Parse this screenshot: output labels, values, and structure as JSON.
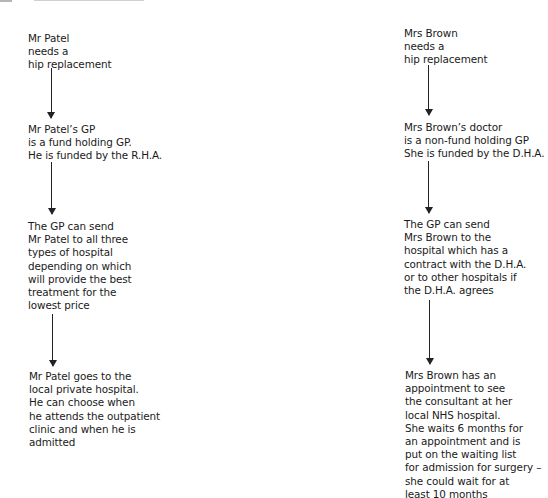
{
  "diagram": {
    "type": "flowchart",
    "header_cutoff": true,
    "columns": [
      {
        "name": "patel",
        "nodes": [
          "Mr Patel\nneeds a\nhip replacement",
          "Mr Patel’s GP\nis a fund holding GP.\nHe is funded by the R.H.A.",
          "The GP can send\nMr Patel to all three\ntypes of hospital\ndepending on which\nwill provide the best\ntreatment for the\nlowest price",
          "Mr Patel goes to the\nlocal private hospital.\nHe can choose when\nhe attends the outpatient\nclinic and when he is\nadmitted"
        ]
      },
      {
        "name": "brown",
        "nodes": [
          "Mrs Brown\nneeds a\nhip replacement",
          "Mrs Brown’s doctor\nis a non-fund holding GP\nShe is funded by the D.H.A.",
          "The GP can send\nMrs Brown to the\nhospital which has a\ncontract with the D.H.A.\nor to other hospitals if\nthe D.H.A. agrees",
          "Mrs Brown has an\nappointment to see\nthe consultant at her\nlocal NHS hospital.\nShe waits 6 months for\nan appointment and is\nput on the waiting list\nfor admission for surgery –\nshe could wait for at\nleast 10 months"
        ]
      }
    ],
    "edges": [
      {
        "column": "patel",
        "from": 0,
        "to": 1
      },
      {
        "column": "patel",
        "from": 1,
        "to": 2
      },
      {
        "column": "patel",
        "from": 2,
        "to": 3
      },
      {
        "column": "brown",
        "from": 0,
        "to": 1
      },
      {
        "column": "brown",
        "from": 1,
        "to": 2
      },
      {
        "column": "brown",
        "from": 2,
        "to": 3
      }
    ]
  }
}
